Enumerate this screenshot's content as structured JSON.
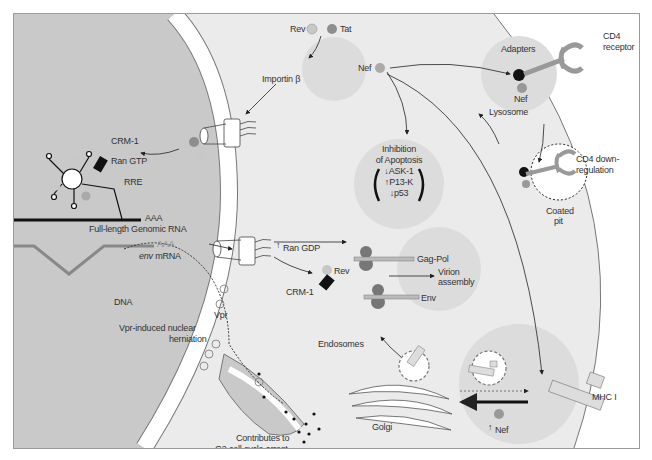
{
  "diagram": {
    "compartments": [
      "nucleus",
      "cytoplasm",
      "plasma membrane",
      "extracellular"
    ],
    "colors": {
      "nucleus": "#c9c9c9",
      "cytoplasm": "#ebebeb",
      "extracellular": "#ffffff",
      "light_circle": "#dcdcdc",
      "protein_light": "#c8c8c8",
      "protein_dark": "#8e8e8e",
      "black": "#111111"
    },
    "labels": {
      "rev_top": "Rev",
      "tat_top": "Tat",
      "importin": "Importin β",
      "crm1_nuc": "CRM-1",
      "ran_gtp": "Ran GTP",
      "rre": "RRE",
      "aaa1": "AAA",
      "genomic_rna": "Full-length Genomic RNA",
      "aaa2": "AAA",
      "env_mrna_italic": "env",
      "env_mrna_rest": " mRNA",
      "ran_gdp": "Ran GDP",
      "ran_gdp_arrow": "↑",
      "rev_cyto": "Rev",
      "crm1_cyto": "CRM-1",
      "gag_pol": "Gag-Pol",
      "virion": "Virion\nassembly",
      "virion_1": "Virion",
      "virion_2": "assembly",
      "env": "Env",
      "nef_top": "Nef",
      "inhibition_1": "Inhibition",
      "inhibition_2": "of Apoptosis",
      "ask1": "↓ASK-1",
      "p13k": "↑P13-K",
      "p53": "↓p53",
      "adapters": "Adapters",
      "nef_adapters": "Nef",
      "cd4_receptor_1": "CD4",
      "cd4_receptor_2": "receptor",
      "lysosome": "Lysosome",
      "cd4_down_1": "CD4 down-",
      "cd4_down_2": "regulation",
      "coated_1": "Coated",
      "coated_2": "pit",
      "dna": "DNA",
      "vpr": "Vpr",
      "vpr_induced_1": "Vpr-induced nuclear",
      "vpr_induced_2": "herniation",
      "g2_1": "Contributes to",
      "g2_2": "G2 cell cycle arrest",
      "endosomes": "Endosomes",
      "golgi": "Golgi",
      "mhc": "MHC I",
      "nef_bottom_arrow": "↑",
      "nef_bottom": "Nef"
    }
  }
}
